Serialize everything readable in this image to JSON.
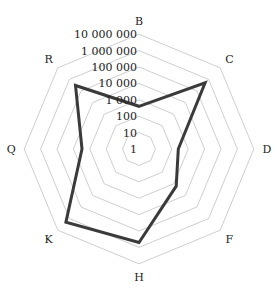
{
  "chart_data": {
    "type": "radar",
    "title": "",
    "scale": "log10",
    "categories": [
      "B",
      "C",
      "D",
      "F",
      "H",
      "K",
      "Q",
      "R"
    ],
    "series": [
      {
        "name": "series1",
        "color": "#3a3a3a",
        "values": [
          400,
          500000,
          250,
          1600,
          500000,
          2000000,
          3000,
          300000
        ]
      }
    ],
    "tick_values": [
      1,
      10,
      100,
      1000,
      10000,
      100000,
      1000000,
      10000000
    ],
    "tick_labels": [
      "1",
      "10",
      "100",
      "1 000",
      "10 000",
      "100 000",
      "1 000 000",
      "10 000 000"
    ],
    "rlim": [
      1,
      10000000
    ],
    "grid": true,
    "grid_shape": "octagon",
    "legend": "none"
  },
  "layout": {
    "cx": 139,
    "cy": 149,
    "radius_per_decade": 16.4,
    "grid_color": "#c8c8c8",
    "line_color": "#3a3a3a"
  }
}
